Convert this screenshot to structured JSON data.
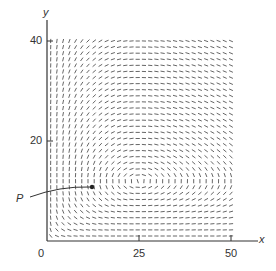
{
  "chart_data": {
    "type": "slope_field",
    "title": "",
    "xlabel": "x",
    "ylabel": "y",
    "xlim": [
      0,
      50
    ],
    "ylim": [
      0,
      40
    ],
    "x_ticks": [
      0,
      25,
      50
    ],
    "y_ticks": [
      20,
      40
    ],
    "x_tick_labels": [
      "0",
      "25",
      "50"
    ],
    "y_tick_labels": [
      "20",
      "40"
    ],
    "grid": false,
    "field": {
      "description": "Direction field, horizontal segments near x=25 and y=0, vertical segments near x=0 and y≈12",
      "x_range": [
        1,
        50
      ],
      "y_range": [
        1,
        40
      ],
      "nx": 30,
      "ny": 33,
      "equilibrium": [
        25,
        12
      ]
    },
    "annotations": [
      {
        "label": "P",
        "point": [
          12,
          11
        ],
        "label_pos": [
          -2,
          9
        ]
      }
    ]
  },
  "labels": {
    "y_axis": "y",
    "x_axis": "x",
    "tick_0": "0",
    "tick_25": "25",
    "tick_50": "50",
    "tick_20": "20",
    "tick_40": "40",
    "point": "P"
  },
  "colors": {
    "ink": "#333333",
    "field": "#555555"
  }
}
